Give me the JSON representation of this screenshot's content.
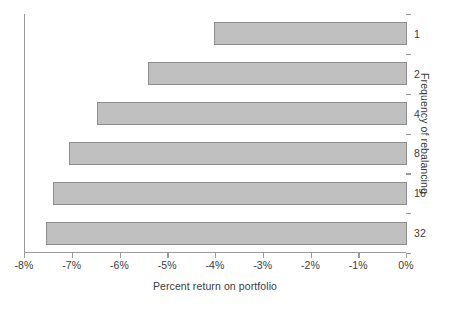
{
  "chart_data": {
    "type": "bar",
    "orientation": "horizontal",
    "title": "",
    "xlabel": "Percent return on portfolio",
    "ylabel": "Frequency of rebalancing",
    "categories": [
      "1",
      "2",
      "4",
      "8",
      "16",
      "32"
    ],
    "values": [
      -4.05,
      -5.43,
      -6.5,
      -7.08,
      -7.42,
      -7.55
    ],
    "xlim": [
      -8,
      0
    ],
    "xticks": [
      -8,
      -7,
      -6,
      -5,
      -4,
      -3,
      -2,
      -1,
      0
    ],
    "xtick_labels": [
      "-8%",
      "-7%",
      "-6%",
      "-5%",
      "-4%",
      "-3%",
      "-2%",
      "-1%",
      "0%"
    ],
    "grid": false,
    "legend": null,
    "legend_position": "none",
    "bar_fill_color": "#c0c0c0",
    "bar_border_color": "#8d8d8d",
    "axis_color": "#9a9a9a",
    "text_color": "#3c3c3c",
    "background_color": "#ffffff"
  },
  "axes": {
    "x_axis_title": "Percent return on portfolio",
    "y_axis_title": "Frequency of rebalancing"
  }
}
